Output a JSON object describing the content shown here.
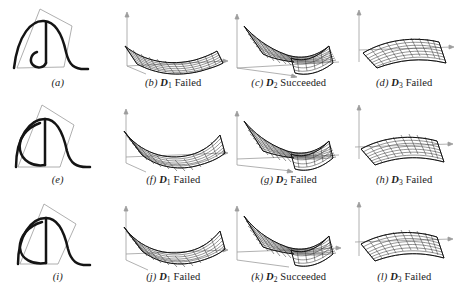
{
  "figure": {
    "background": "#ffffff",
    "ink": "#1a1a1a",
    "axis_color": "#9a9a9a",
    "mesh_color": "#3a3a3a",
    "curve_color": "#111111",
    "polygon_color": "#9a9a9a",
    "rows": 3,
    "cols": 4
  },
  "panels": [
    {
      "id": "a",
      "index_label": "(a)",
      "dataset": "",
      "subscript": "",
      "status": "",
      "caption_full": "(a)",
      "kind": "curve",
      "curve_variant": "cusp"
    },
    {
      "id": "b",
      "index_label": "(b)",
      "dataset": "D",
      "subscript": "1",
      "status": "Failed",
      "caption_full": "(b) D1 Failed",
      "kind": "surface",
      "surface_variant": "flat-warped"
    },
    {
      "id": "c",
      "index_label": "(c)",
      "dataset": "D",
      "subscript": "2",
      "status": "Succeeded",
      "caption_full": "(c) D2 Succeeded",
      "kind": "surface",
      "surface_variant": "butterfly-fold"
    },
    {
      "id": "d",
      "index_label": "(d)",
      "dataset": "D",
      "subscript": "3",
      "status": "Failed",
      "caption_full": "(d) D3 Failed",
      "kind": "surface",
      "surface_variant": "gentle-sheet"
    },
    {
      "id": "e",
      "index_label": "(e)",
      "dataset": "",
      "subscript": "",
      "status": "",
      "caption_full": "(e)",
      "kind": "curve",
      "curve_variant": "loop-wide"
    },
    {
      "id": "f",
      "index_label": "(f)",
      "dataset": "D",
      "subscript": "1",
      "status": "Failed",
      "caption_full": "(f) D1 Failed",
      "kind": "surface",
      "surface_variant": "saddle-curled"
    },
    {
      "id": "g",
      "index_label": "(g)",
      "dataset": "D",
      "subscript": "2",
      "status": "Failed",
      "caption_full": "(g) D2 Failed",
      "kind": "surface",
      "surface_variant": "butterfly-fold"
    },
    {
      "id": "h",
      "index_label": "(h)",
      "dataset": "D",
      "subscript": "3",
      "status": "Failed",
      "caption_full": "(h) D3 Failed",
      "kind": "surface",
      "surface_variant": "gentle-sheet"
    },
    {
      "id": "i",
      "index_label": "(i)",
      "dataset": "",
      "subscript": "",
      "status": "",
      "caption_full": "(i)",
      "kind": "curve",
      "curve_variant": "loop-tight"
    },
    {
      "id": "j",
      "index_label": "(j)",
      "dataset": "D",
      "subscript": "1",
      "status": "Failed",
      "caption_full": "(j) D1 Failed",
      "kind": "surface",
      "surface_variant": "saddle-curled"
    },
    {
      "id": "k",
      "index_label": "(k)",
      "dataset": "D",
      "subscript": "2",
      "status": "Succeeded",
      "caption_full": "(k) D2 Succeeded",
      "kind": "surface",
      "surface_variant": "butterfly-fold"
    },
    {
      "id": "l",
      "index_label": "(l)",
      "dataset": "D",
      "subscript": "3",
      "status": "Failed",
      "caption_full": "(l) D3 Failed",
      "kind": "surface",
      "surface_variant": "gentle-sheet"
    }
  ]
}
